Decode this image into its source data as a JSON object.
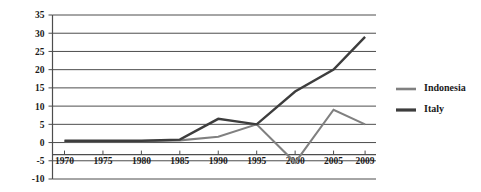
{
  "chart_data": {
    "type": "line",
    "title": "",
    "xlabel": "",
    "ylabel": "",
    "x": [
      1970,
      1975,
      1980,
      1985,
      1990,
      1995,
      2000,
      2005,
      2009
    ],
    "categories": [
      "1970",
      "1975",
      "1980",
      "1985",
      "1990",
      "1995",
      "2000",
      "2005",
      "2009"
    ],
    "series": [
      {
        "name": "Indonesia",
        "color": "#808080",
        "values": [
          0.4,
          0.4,
          0.4,
          0.6,
          1.6,
          5.0,
          -5.5,
          9.0,
          5.0
        ]
      },
      {
        "name": "Italy",
        "color": "#3d3d3d",
        "values": [
          0.5,
          0.5,
          0.5,
          0.8,
          6.5,
          5.0,
          14.0,
          20.0,
          29.0
        ]
      }
    ],
    "ylim": [
      -10,
      35
    ],
    "yticks": [
      -10,
      -5,
      0,
      5,
      10,
      15,
      20,
      25,
      30,
      35
    ],
    "ytick_labels": [
      "-10",
      "-5",
      "0",
      "5",
      "10",
      "15",
      "20",
      "25",
      "30",
      "35"
    ],
    "grid": true,
    "legend_position": "right"
  },
  "legend": {
    "items": [
      {
        "label": "Indonesia"
      },
      {
        "label": "Italy"
      }
    ]
  }
}
